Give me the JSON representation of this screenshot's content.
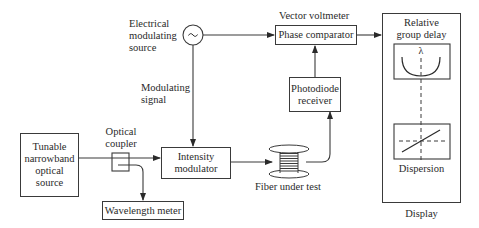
{
  "diagram": {
    "blocks": {
      "source": {
        "label_lines": [
          "Tunable",
          "narrowband",
          "optical",
          "source"
        ]
      },
      "coupler": {
        "label": "Optical coupler",
        "label_lines": [
          "Optical",
          "coupler"
        ]
      },
      "wavelength_meter": {
        "label": "Wavelength meter"
      },
      "intensity_modulator": {
        "label_lines": [
          "Intensity",
          "modulator"
        ]
      },
      "electrical_source": {
        "label_lines": [
          "Electrical",
          "modulating",
          "source"
        ],
        "icon": "sine-wave"
      },
      "modulating_signal": {
        "label_lines": [
          "Modulating",
          "signal"
        ]
      },
      "fiber": {
        "label": "Fiber under test"
      },
      "photodiode": {
        "label_lines": [
          "Photodiode",
          "receiver"
        ]
      },
      "vector_voltmeter": {
        "label": "Vector voltmeter"
      },
      "phase_comparator": {
        "label": "Phase comparator"
      },
      "display": {
        "label": "Display",
        "group_delay": {
          "label_lines": [
            "Relative",
            "group delay"
          ],
          "axis_symbol": "λ"
        },
        "dispersion": {
          "label": "Dispersion"
        }
      }
    },
    "colors": {
      "line": "#3a3a3a",
      "text": "#2a2a2a",
      "background": "#ffffff"
    }
  }
}
